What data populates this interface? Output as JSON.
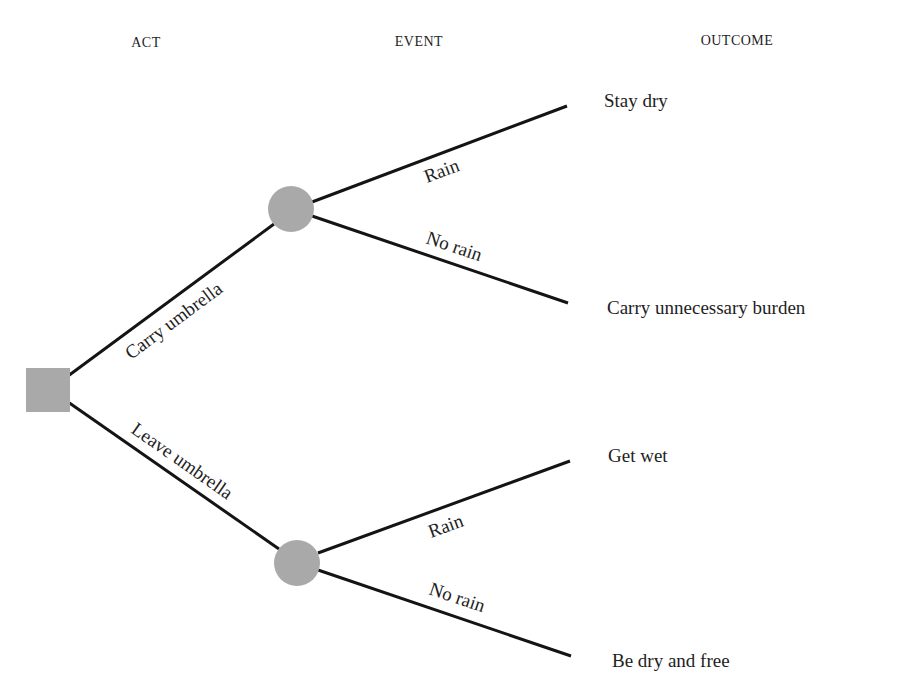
{
  "headers": {
    "act": "ACT",
    "event": "EVENT",
    "outcome": "OUTCOME"
  },
  "colors": {
    "node_fill": "#a9a9a9",
    "line": "#141414",
    "text": "#1e1e1e",
    "background": "#ffffff"
  },
  "decision_node": {
    "shape": "square",
    "label": ""
  },
  "acts": [
    {
      "label": "Carry umbrella",
      "chance_node": "circle",
      "events": [
        {
          "label": "Rain",
          "outcome": "Stay dry"
        },
        {
          "label": "No rain",
          "outcome": "Carry unnecessary burden"
        }
      ]
    },
    {
      "label": "Leave umbrella",
      "chance_node": "circle",
      "events": [
        {
          "label": "Rain",
          "outcome": "Get wet"
        },
        {
          "label": "No rain",
          "outcome": "Be dry and free"
        }
      ]
    }
  ]
}
